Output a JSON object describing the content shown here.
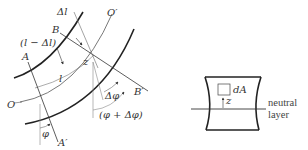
{
  "left_figure": {
    "labels": {
      "delta_l": "Δl",
      "B": "B",
      "l_minus_delta_l": "(l − Δl)",
      "A": "A",
      "O_prime": "O′",
      "z": "z",
      "l": "l",
      "O": "O",
      "delta_phi": "Δφ",
      "B_prime": "B′",
      "phi_plus_delta_phi": "(φ + Δφ)",
      "phi": "φ",
      "A_prime": "A′"
    }
  },
  "right_figure": {
    "labels": {
      "dA": "dA",
      "z": "z",
      "neutral": "neutral",
      "layer": "layer"
    }
  },
  "colors": {
    "thick_stroke": "#222222",
    "thin_stroke": "#555555",
    "text": "#333333"
  }
}
